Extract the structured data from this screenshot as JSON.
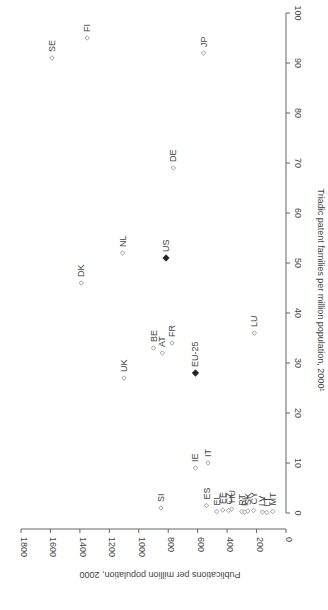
{
  "chart_data": {
    "type": "scatter",
    "orientation": "rotated-90-ccw",
    "title": "",
    "xlabel": "Triadic patent families per million population, 2000¹",
    "ylabel": "Publications per million population, 2000",
    "xlim": [
      0,
      100
    ],
    "ylim": [
      0,
      1800
    ],
    "xticks": [
      0,
      10,
      20,
      30,
      40,
      50,
      60,
      70,
      80,
      90,
      100
    ],
    "yticks": [
      0,
      200,
      400,
      600,
      800,
      1000,
      1200,
      1400,
      1600,
      1800
    ],
    "grid": false,
    "legend": "none",
    "colors": {
      "marker": "#888888",
      "highlight": "#222222",
      "axis": "#666666",
      "text": "#444444"
    },
    "points": [
      {
        "label": "SE",
        "x": 91,
        "y": 1590,
        "highlight": false
      },
      {
        "label": "FI",
        "x": 95,
        "y": 1350,
        "highlight": false
      },
      {
        "label": "JP",
        "x": 92,
        "y": 560,
        "highlight": false
      },
      {
        "label": "DE",
        "x": 69,
        "y": 765,
        "highlight": false
      },
      {
        "label": "DK",
        "x": 46,
        "y": 1390,
        "highlight": false
      },
      {
        "label": "NL",
        "x": 52,
        "y": 1110,
        "highlight": false
      },
      {
        "label": "US",
        "x": 51,
        "y": 815,
        "highlight": true
      },
      {
        "label": "UK",
        "x": 27,
        "y": 1100,
        "highlight": false
      },
      {
        "label": "BE",
        "x": 33,
        "y": 900,
        "highlight": false
      },
      {
        "label": "AT",
        "x": 32,
        "y": 840,
        "highlight": false
      },
      {
        "label": "FR",
        "x": 34,
        "y": 775,
        "highlight": false
      },
      {
        "label": "EU-25",
        "x": 28,
        "y": 615,
        "highlight": true
      },
      {
        "label": "LU",
        "x": 36,
        "y": 215,
        "highlight": false
      },
      {
        "label": "IE",
        "x": 9,
        "y": 615,
        "highlight": false
      },
      {
        "label": "IT",
        "x": 10,
        "y": 530,
        "highlight": false
      },
      {
        "label": "SI",
        "x": 1,
        "y": 850,
        "highlight": false
      },
      {
        "label": "ES",
        "x": 1.5,
        "y": 540,
        "highlight": false
      },
      {
        "label": "HU",
        "x": 0.8,
        "y": 370,
        "highlight": false
      },
      {
        "label": "EE",
        "x": 0.6,
        "y": 430,
        "highlight": false
      },
      {
        "label": "EL",
        "x": 0.3,
        "y": 470,
        "highlight": false
      },
      {
        "label": "CZ",
        "x": 0.5,
        "y": 390,
        "highlight": false
      },
      {
        "label": "PT",
        "x": 0.3,
        "y": 300,
        "highlight": false
      },
      {
        "label": "PL",
        "x": 0.2,
        "y": 280,
        "highlight": false
      },
      {
        "label": "SK",
        "x": 0.4,
        "y": 260,
        "highlight": false
      },
      {
        "label": "CY",
        "x": 0.5,
        "y": 220,
        "highlight": false
      },
      {
        "label": "LV",
        "x": 0.2,
        "y": 160,
        "highlight": false
      },
      {
        "label": "LT",
        "x": 0.1,
        "y": 130,
        "highlight": false
      },
      {
        "label": "MT",
        "x": 0.3,
        "y": 90,
        "highlight": false
      }
    ]
  }
}
